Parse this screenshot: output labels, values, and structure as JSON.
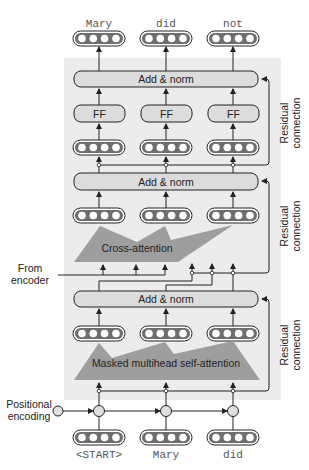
{
  "diagram": {
    "type": "transformer-decoder",
    "colors": {
      "background": "#ffffff",
      "shaded_region": "#ececec",
      "box_fill": "#dcdcdc",
      "vector_fill": "#6e6e6e",
      "vector_dot": "#ffffff",
      "attention_polygon": "#9e9e9e",
      "line": "#222222"
    },
    "output_tokens": [
      "Mary",
      "did",
      "not"
    ],
    "input_tokens": [
      "<START>",
      "Mary",
      "did"
    ],
    "blocks": {
      "top_add_norm": "Add & norm",
      "ff_labels": [
        "FF",
        "FF",
        "FF"
      ],
      "middle_add_norm": "Add & norm",
      "cross_attention": "Cross-attention",
      "bottom_add_norm": "Add & norm",
      "masked_attention": "Masked multihead self-attention"
    },
    "side_labels": {
      "from_encoder_line1": "From",
      "from_encoder_line2": "encoder",
      "positional_line1": "Positional",
      "positional_line2": "encoding"
    },
    "residual": {
      "line1": "Residual",
      "line2": "connection"
    }
  }
}
